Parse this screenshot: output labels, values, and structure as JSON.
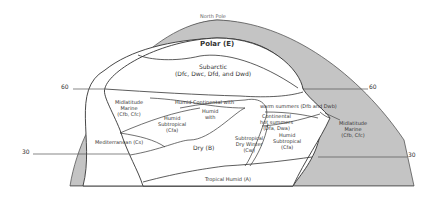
{
  "diagram": {
    "title": "North Pole",
    "latitude_labels": {
      "left_60": "60",
      "right_60": "60",
      "left_30": "30",
      "right_30": "30"
    },
    "regions": {
      "polar": "Polar (E)",
      "subarctic_line1": "Subarctic",
      "subarctic_line2": "(Dfc, Dwc, Dfd, and Dwd)",
      "midlatitude_marine_left_line1": "Midlatitude",
      "midlatitude_marine_left_line2": "Marine",
      "midlatitude_marine_left_line3": "(Cfb, Cfc)",
      "humid_continental": "Humid Continental with",
      "warm_summers": "warm summers (Dfb and Dwb)",
      "humid_with_line1": "Humid",
      "humid_with_line2": "with",
      "humid_subtropical_left_line1": "Humid",
      "humid_subtropical_left_line2": "Subtropical",
      "humid_subtropical_left_line3": "(Cfa)",
      "mediterranean": "Mediterranean (Cs)",
      "dry": "Dry (B)",
      "continental_hot_line1": "Continental",
      "continental_hot_line2": "hot summers",
      "continental_hot_line3": "(Dfa, Dwa)",
      "subtropical_dry_winter_line1": "Subtropical",
      "subtropical_dry_winter_line2": "Dry Winter",
      "subtropical_dry_winter_line3": "(Cw)",
      "humid_subtropical_right_line1": "Humid",
      "humid_subtropical_right_line2": "Subtropical",
      "humid_subtropical_right_line3": "(Cfa)",
      "midlatitude_marine_right_line1": "Midlatitude",
      "midlatitude_marine_right_line2": "Marine",
      "midlatitude_marine_right_line3": "(Cfb, Cfc)",
      "tropical_humid": "Tropical Humid (A)"
    },
    "colors": {
      "ocean_band": "#c4c4c4",
      "land": "#ffffff",
      "lines": "#333333"
    }
  }
}
